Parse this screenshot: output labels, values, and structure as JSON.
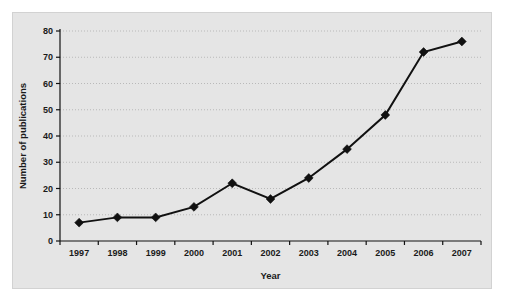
{
  "chart_data": {
    "type": "line",
    "title": "",
    "subtitle": "",
    "xlabel": "Year",
    "ylabel": "Number of publications",
    "categories": [
      "1997",
      "1998",
      "1999",
      "2000",
      "2001",
      "2002",
      "2003",
      "2004",
      "2005",
      "2006",
      "2007"
    ],
    "values": [
      7,
      9,
      9,
      13,
      22,
      16,
      24,
      35,
      48,
      72,
      76
    ],
    "series": [
      {
        "name": "Number of publications",
        "values": [
          7,
          9,
          9,
          13,
          22,
          16,
          24,
          35,
          48,
          72,
          76
        ]
      }
    ],
    "ylim": [
      0,
      80
    ],
    "yticks": [
      "0",
      "10",
      "20",
      "30",
      "40",
      "50",
      "60",
      "70",
      "80"
    ],
    "ytick_values": [
      0,
      10,
      20,
      30,
      40,
      50,
      60,
      70,
      80
    ],
    "xticks": [
      "1997",
      "1998",
      "1999",
      "2000",
      "2001",
      "2002",
      "2003",
      "2004",
      "2005",
      "2006",
      "2007"
    ],
    "grid": "horizontal-dotted",
    "legend": "none",
    "marker": "filled-diamond",
    "line_color": "#111111",
    "marker_color": "#111111",
    "grid_color": "#b9b9b9",
    "panel_background": "#e5e5e5",
    "figure_background": "#ffffff",
    "annotations": []
  }
}
